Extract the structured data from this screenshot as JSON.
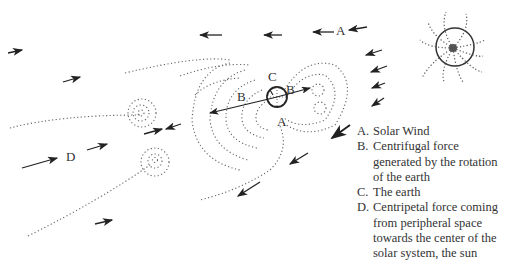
{
  "diagram": {
    "type": "solar-earth force diagram",
    "labels": {
      "a_top": "A",
      "a_bottom": "A",
      "b_left": "B",
      "b_right": "B",
      "c": "C",
      "d": "D"
    },
    "entities": [
      "sun",
      "earth",
      "solar wind arrows",
      "centrifugal force arrows",
      "centripetal force arrows",
      "dotted field lines"
    ]
  },
  "legend": [
    {
      "key": "A.",
      "text": "Solar Wind"
    },
    {
      "key": "B.",
      "text": "Centrifugal force generated by the rotation of the earth"
    },
    {
      "key": "C.",
      "text": "The earth"
    },
    {
      "key": "D.",
      "text": "Centripetal force coming from peripheral space towards the center of the solar system, the sun"
    }
  ],
  "colors": {
    "ink": "#222222",
    "dots": "#666666",
    "background": "#ffffff"
  }
}
